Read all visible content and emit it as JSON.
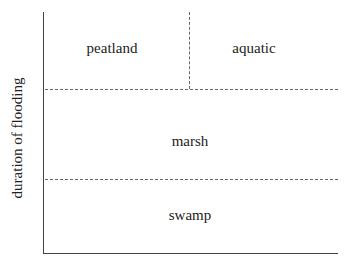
{
  "diagram": {
    "y_axis_label": "duration of flooding",
    "regions": [
      {
        "name": "peatland"
      },
      {
        "name": "aquatic"
      },
      {
        "name": "marsh"
      },
      {
        "name": "swamp"
      }
    ]
  }
}
